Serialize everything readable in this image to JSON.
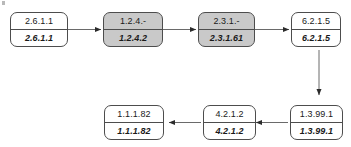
{
  "diagram": {
    "type": "flowchart",
    "colors": {
      "shaded_fill": "#c9c9c9",
      "plain_fill": "#ffffff",
      "stroke": "#4d4d4d",
      "text": "#1a1a1a"
    },
    "nodes": [
      {
        "id": "n1",
        "top": "2.6.1.1",
        "bottom": "2.6.1.1",
        "shaded": false
      },
      {
        "id": "n2",
        "top": "1.2.4.-",
        "bottom": "1.2.4.2",
        "shaded": true
      },
      {
        "id": "n3",
        "top": "2.3.1.-",
        "bottom": "2.3.1.61",
        "shaded": true
      },
      {
        "id": "n4",
        "top": "6.2.1.5",
        "bottom": "6.2.1.5",
        "shaded": false
      },
      {
        "id": "n5",
        "top": "1.3.99.1",
        "bottom": "1.3.99.1",
        "shaded": false
      },
      {
        "id": "n6",
        "top": "4.2.1.2",
        "bottom": "4.2.1.2",
        "shaded": false
      },
      {
        "id": "n7",
        "top": "1.1.1.82",
        "bottom": "1.1.1.82",
        "shaded": false
      }
    ],
    "edges": [
      {
        "id": "e1",
        "from": "n1",
        "to": "n2",
        "direction": "right"
      },
      {
        "id": "e2",
        "from": "n2",
        "to": "n3",
        "direction": "right"
      },
      {
        "id": "e3",
        "from": "n3",
        "to": "n4",
        "direction": "right"
      },
      {
        "id": "e4",
        "from": "n4",
        "to": "n5",
        "direction": "down"
      },
      {
        "id": "e5",
        "from": "n5",
        "to": "n6",
        "direction": "left"
      },
      {
        "id": "e6",
        "from": "n6",
        "to": "n7",
        "direction": "left"
      }
    ]
  }
}
